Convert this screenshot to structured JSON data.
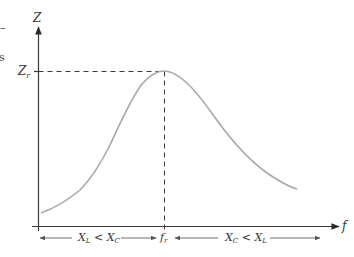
{
  "figure": {
    "type": "resonance-curve",
    "y_axis_label": "Z",
    "x_axis_label": "f",
    "peak_y_label": "Z",
    "peak_y_label_sub": "r",
    "peak_x_label": "f",
    "peak_x_label_sub": "r",
    "left_region": {
      "a": "X",
      "a_sub": "L",
      "op": " < ",
      "b": "X",
      "b_sub": "C"
    },
    "right_region": {
      "a": "X",
      "a_sub": "C",
      "op": " < ",
      "b": "X",
      "b_sub": "L"
    },
    "edge_fragments": [
      "–",
      "s"
    ]
  },
  "colors": {
    "axis": "#3a3a3a",
    "curve": "#a8a8a8",
    "region_arrows": "#707070",
    "text": "#333333"
  }
}
